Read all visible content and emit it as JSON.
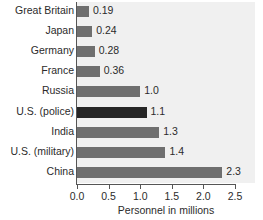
{
  "chart_data": {
    "type": "bar",
    "orientation": "horizontal",
    "title": "",
    "xlabel": "Personnel in millions",
    "ylabel": "",
    "xlim": [
      0.0,
      2.5
    ],
    "xticks": [
      "0.0",
      "0.5",
      "1.0",
      "1.5",
      "2.0",
      "2.5"
    ],
    "xtick_values": [
      0.0,
      0.5,
      1.0,
      1.5,
      2.0,
      2.5
    ],
    "grid": false,
    "legend": "none",
    "categories": [
      "Great Britain",
      "Japan",
      "Germany",
      "France",
      "Russia",
      "U.S. (police)",
      "India",
      "U.S. (military)",
      "China"
    ],
    "values": [
      0.19,
      0.24,
      0.28,
      0.36,
      1.0,
      1.1,
      1.3,
      1.4,
      2.3
    ],
    "value_labels": [
      "0.19",
      "0.24",
      "0.28",
      "0.36",
      "1.0",
      "1.1",
      "1.3",
      "1.4",
      "2.3"
    ],
    "bars": [
      {
        "label": "Great Britain",
        "value": 0.19,
        "value_label": "0.19",
        "highlight": false
      },
      {
        "label": "Japan",
        "value": 0.24,
        "value_label": "0.24",
        "highlight": false
      },
      {
        "label": "Germany",
        "value": 0.28,
        "value_label": "0.28",
        "highlight": false
      },
      {
        "label": "France",
        "value": 0.36,
        "value_label": "0.36",
        "highlight": false
      },
      {
        "label": "Russia",
        "value": 1.0,
        "value_label": "1.0",
        "highlight": false
      },
      {
        "label": "U.S. (police)",
        "value": 1.1,
        "value_label": "1.1",
        "highlight": true
      },
      {
        "label": "India",
        "value": 1.3,
        "value_label": "1.3",
        "highlight": false
      },
      {
        "label": "U.S. (military)",
        "value": 1.4,
        "value_label": "1.4",
        "highlight": false
      },
      {
        "label": "China",
        "value": 2.3,
        "value_label": "2.3",
        "highlight": false
      }
    ]
  },
  "colors": {
    "bar": "#6f6f6f",
    "bar_highlight": "#262626",
    "plot_background": "#f0f0f0",
    "page_background": "#ffffff",
    "axis": "#555555",
    "text": "#2b2b2b"
  }
}
